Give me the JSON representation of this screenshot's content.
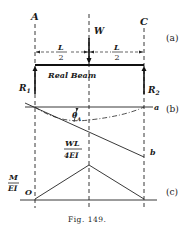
{
  "figure": {
    "caption": "Fig. 149.",
    "panels": {
      "a": {
        "tag": "(a)",
        "support_left": "A",
        "support_right": "C",
        "load": "W",
        "span_left_num": "L",
        "span_left_den": "2",
        "span_right_num": "L",
        "span_right_den": "2",
        "beam_label": "Real Beam",
        "reaction_left": "R",
        "reaction_left_sub": "1",
        "reaction_right": "R",
        "reaction_right_sub": "2"
      },
      "b": {
        "tag": "(b)",
        "line_a": "a",
        "line_b": "b",
        "angle": "θ",
        "angle_sub": "A"
      },
      "c": {
        "tag": "(c)",
        "peak_num": "WL",
        "peak_den": "4EI",
        "axis_num": "M",
        "axis_den": "EI",
        "origin": "O"
      }
    }
  }
}
